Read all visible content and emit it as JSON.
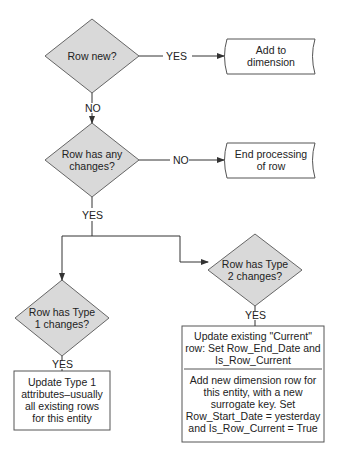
{
  "diagram": {
    "type": "flowchart",
    "colors": {
      "decision_fill": "#d9d9d9",
      "stroke": "#555555",
      "box_fill": "#ffffff",
      "text": "#222222"
    },
    "decisions": [
      {
        "id": "row-new",
        "line1": "Row new?",
        "line2": ""
      },
      {
        "id": "row-changes",
        "line1": "Row has any",
        "line2": "changes?"
      },
      {
        "id": "type2",
        "line1": "Row has Type",
        "line2": "2 changes?"
      },
      {
        "id": "type1",
        "line1": "Row has Type",
        "line2": "1 changes?"
      }
    ],
    "terminals": [
      {
        "id": "add-dim",
        "line1": "Add to",
        "line2": "dimension"
      },
      {
        "id": "end-proc",
        "line1": "End processing",
        "line2": "of row"
      }
    ],
    "type1_box": {
      "lines": [
        "Update Type 1",
        "attributes–usually",
        "all existing rows",
        "for this entity"
      ]
    },
    "type2_box": {
      "top_lines": [
        "Update existing \"Current\"",
        "row: Set Row_End_Date and",
        "Is_Row_Current"
      ],
      "bottom_lines": [
        "Add new dimension row for",
        "this entity, with a new",
        "surrogate key. Set",
        "Row_Start_Date = yesterday",
        "and Is_Row_Current = True"
      ]
    },
    "edge_labels": {
      "new_yes": "YES",
      "new_no": "NO",
      "changes_no": "NO",
      "changes_yes": "YES",
      "type2_yes": "YES",
      "type1_yes": "YES"
    }
  }
}
